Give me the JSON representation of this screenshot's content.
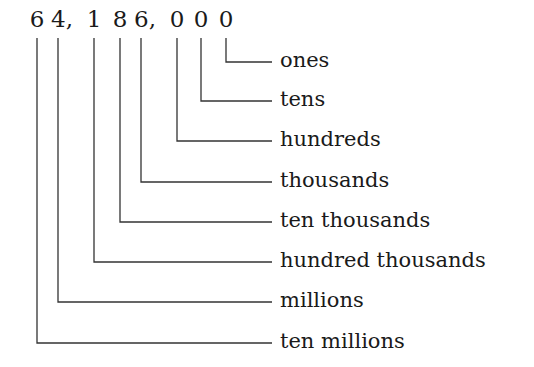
{
  "number": "64,186,000",
  "digits": [
    {
      "char": "6",
      "comma": false,
      "x": 37
    },
    {
      "char": "4",
      "comma": true,
      "x": 62
    },
    {
      "char": "1",
      "comma": false,
      "x": 94
    },
    {
      "char": "8",
      "comma": false,
      "x": 120
    },
    {
      "char": "6",
      "comma": true,
      "x": 145
    },
    {
      "char": "0",
      "comma": false,
      "x": 177
    },
    {
      "char": "0",
      "comma": false,
      "x": 201
    },
    {
      "char": "0",
      "comma": false,
      "x": 226
    }
  ],
  "labels": [
    {
      "text": "ones",
      "y": 62
    },
    {
      "text": "tens",
      "y": 101
    },
    {
      "text": "hundreds",
      "y": 141
    },
    {
      "text": "thousands",
      "y": 182
    },
    {
      "text": "ten thousands",
      "y": 222
    },
    {
      "text": "hundred thousands",
      "y": 262
    },
    {
      "text": "millions",
      "y": 302
    },
    {
      "text": "ten millions",
      "y": 343
    }
  ],
  "line_color": "#333333"
}
